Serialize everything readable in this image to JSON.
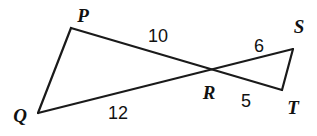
{
  "figure": {
    "type": "geometry-diagram",
    "width": 317,
    "height": 136,
    "background_color": "#ffffff",
    "stroke_color": "#1a1a1a",
    "text_color": "#111111"
  },
  "vertices": [
    {
      "id": "P",
      "label": "P",
      "point_x": 71,
      "point_y": 28,
      "label_x": 83,
      "label_y": 15
    },
    {
      "id": "Q",
      "label": "Q",
      "point_x": 38,
      "point_y": 113,
      "label_x": 20,
      "label_y": 115
    },
    {
      "id": "R",
      "label": "R",
      "point_x": 212,
      "point_y": 73,
      "label_x": 209,
      "label_y": 92
    },
    {
      "id": "S",
      "label": "S",
      "point_x": 293,
      "point_y": 49,
      "label_x": 299,
      "label_y": 26
    },
    {
      "id": "T",
      "label": "T",
      "point_x": 282,
      "point_y": 90,
      "label_x": 293,
      "label_y": 107
    }
  ],
  "segments": [
    {
      "id": "PQ",
      "from": "P",
      "to": "Q",
      "x1": 71,
      "y1": 28,
      "x2": 38,
      "y2": 113
    },
    {
      "id": "PT",
      "from": "P",
      "to": "T",
      "x1": 71,
      "y1": 28,
      "x2": 282,
      "y2": 90
    },
    {
      "id": "QS",
      "from": "Q",
      "to": "S",
      "x1": 38,
      "y1": 113,
      "x2": 293,
      "y2": 49
    },
    {
      "id": "ST",
      "from": "S",
      "to": "T",
      "x1": 293,
      "y1": 49,
      "x2": 282,
      "y2": 90
    }
  ],
  "measures": [
    {
      "id": "PR",
      "value": "10",
      "x": 158,
      "y": 36
    },
    {
      "id": "QR",
      "value": "12",
      "x": 118,
      "y": 113
    },
    {
      "id": "RS",
      "value": "6",
      "x": 259,
      "y": 46
    },
    {
      "id": "RT",
      "value": "5",
      "x": 246,
      "y": 101
    }
  ]
}
